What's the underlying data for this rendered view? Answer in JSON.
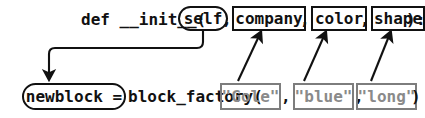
{
  "diagram": {
    "colors": {
      "ink": "#111111",
      "gray": "#8a8a8a",
      "gray_border": "#7d7d7d",
      "background": "#ffffff"
    },
    "top_line": {
      "prefix": "def __init__(",
      "self_token": "self",
      "comma_after_self": ",",
      "params": [
        {
          "label": "company",
          "trailing": ","
        },
        {
          "label": "color",
          "trailing": ","
        },
        {
          "label": "shape",
          "trailing": ""
        }
      ],
      "close_paren": ")",
      "colon": ":"
    },
    "bottom_line": {
      "assign_token": "newblock =",
      "call_name": "block_factory(",
      "args": [
        {
          "label": "\"Gole\"",
          "trailing": ","
        },
        {
          "label": "\"blue\"",
          "trailing": ","
        },
        {
          "label": "\"long\"",
          "trailing": ""
        }
      ],
      "close_paren": ")"
    },
    "arrows": [
      {
        "name": "self-to-newblock",
        "from": "self",
        "to": "newblock =",
        "direction": "down-left"
      },
      {
        "name": "gole-to-company",
        "from": "\"Gole\"",
        "to": "company",
        "direction": "up-right"
      },
      {
        "name": "blue-to-color",
        "from": "\"blue\"",
        "to": "color",
        "direction": "up-right"
      },
      {
        "name": "long-to-shape",
        "from": "\"long\"",
        "to": "shape",
        "direction": "up-right"
      }
    ]
  }
}
